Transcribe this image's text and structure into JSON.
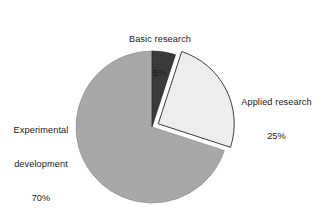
{
  "chart_data": {
    "type": "pie",
    "title": "",
    "subtitle": "",
    "xlabel": "",
    "ylabel": "",
    "grid": false,
    "legend_position": "none",
    "label_style": "outside-callout",
    "units": "percent",
    "total": 100,
    "categories": [
      "Basic research",
      "Applied research",
      "Experimental development"
    ],
    "values": [
      5,
      25,
      70
    ],
    "slices": [
      {
        "name": "Basic research",
        "value": 5,
        "value_label": "5%",
        "color": "#3a3a3a",
        "start_angle_deg": 0,
        "end_angle_deg": 18,
        "exploded": false,
        "explode_offset": 0
      },
      {
        "name": "Applied research",
        "value": 25,
        "value_label": "25%",
        "color": "#ededed",
        "start_angle_deg": 18,
        "end_angle_deg": 108,
        "exploded": true,
        "explode_offset": 7
      },
      {
        "name": "Experimental development",
        "value": 70,
        "value_label": "70%",
        "color": "#a8a8a8",
        "start_angle_deg": 108,
        "end_angle_deg": 360,
        "exploded": false,
        "explode_offset": 0
      }
    ],
    "geometry": {
      "center_x": 152,
      "center_y": 127,
      "radius": 76,
      "start_at_twelve_oclock": true,
      "direction": "clockwise"
    },
    "style": {
      "background": "#ffffff",
      "outline_color": "#333333",
      "outline_width": 0.9,
      "text_color": "#1a1a1a"
    }
  },
  "labels": {
    "basic": {
      "name": "Basic research",
      "value": "5%"
    },
    "applied": {
      "name": "Applied research",
      "value": "25%"
    },
    "experimental": {
      "name_line1": "Experimental",
      "name_line2": "development",
      "value": "70%"
    }
  }
}
